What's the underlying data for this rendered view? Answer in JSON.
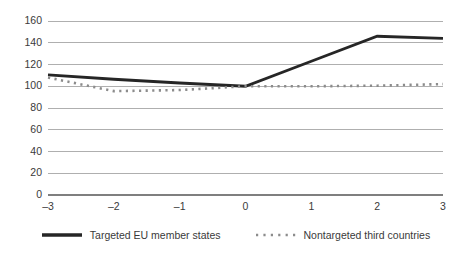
{
  "chart_data": {
    "type": "line",
    "title": "",
    "xlabel": "",
    "ylabel": "",
    "x": [
      -3,
      -2,
      -1,
      0,
      1,
      2,
      3
    ],
    "xtick_labels": [
      "–3",
      "–2",
      "–1",
      "0",
      "1",
      "2",
      "3"
    ],
    "ytick_labels": [
      "0",
      "20",
      "40",
      "60",
      "80",
      "100",
      "120",
      "140",
      "160"
    ],
    "yticks": [
      0,
      20,
      40,
      60,
      80,
      100,
      120,
      140,
      160
    ],
    "ylim": [
      0,
      160
    ],
    "xlim": [
      -3,
      3
    ],
    "grid": true,
    "legend_position": "bottom",
    "series": [
      {
        "name": "Targeted EU member states",
        "style": "solid",
        "color": "#262626",
        "values": [
          110.5,
          106.5,
          103.0,
          100.0,
          123.0,
          146.0,
          144.0
        ]
      },
      {
        "name": "Nontargeted third countries",
        "style": "dotted",
        "color": "#8c8c8c",
        "values": [
          108.0,
          95.5,
          96.5,
          100.0,
          100.0,
          100.5,
          102.0
        ]
      }
    ]
  },
  "legend": {
    "entries": [
      {
        "label": "Targeted EU member states",
        "marker": "solid-line-swatch"
      },
      {
        "label": "Nontargeted third countries",
        "marker": "dotted-line-swatch"
      }
    ]
  },
  "colors": {
    "background": "#ffffff",
    "gridline": "#a6a6a6",
    "axis": "#7f7f7f",
    "text": "#3a3a3a",
    "series_targeted": "#262626",
    "series_nontargeted": "#8c8c8c"
  }
}
